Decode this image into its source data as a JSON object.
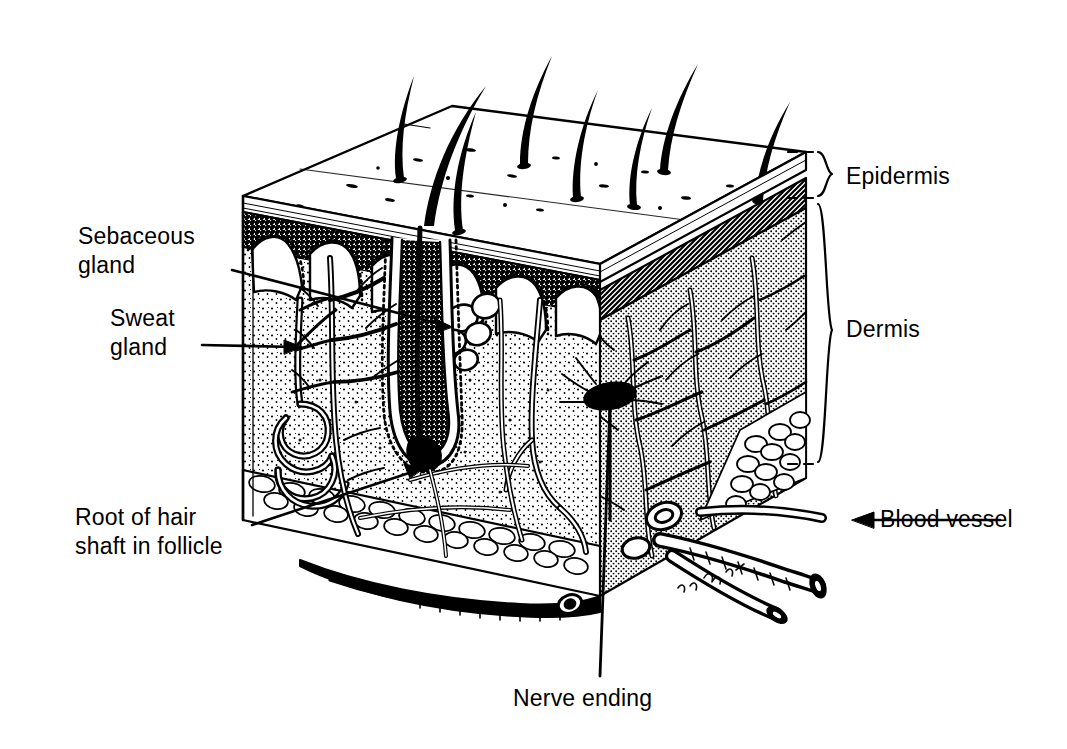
{
  "figure": {
    "kind": "anatomical-cross-section",
    "style": "black-and-white pen-and-ink line drawing",
    "signature": "R. Brent"
  },
  "labels": {
    "epidermis": "Epidermis",
    "dermis": "Dermis",
    "sebaceous_gland": "Sebaceous\ngland",
    "sebaceous_gland_line1": "Sebaceous",
    "sebaceous_gland_line2": "gland",
    "sweat_gland_line1": "Sweat",
    "sweat_gland_line2": "gland",
    "root_hair_line1": "Root of hair",
    "root_hair_line2": "shaft in follicle",
    "blood_vessel": "Blood vessel",
    "nerve_ending": "Nerve ending"
  },
  "colors": {
    "ink": "#000000",
    "paper": "#ffffff",
    "epidermis_band": "#1a1a1a",
    "dermis_stipple": "#000000"
  },
  "structures": [
    {
      "name": "hair shafts",
      "count": 8,
      "location": "epidermal surface"
    },
    {
      "name": "epidermis layer",
      "location": "top band of block"
    },
    {
      "name": "dermis layer",
      "location": "middle body of block"
    },
    {
      "name": "subcutaneous fat",
      "location": "bottom of block"
    },
    {
      "name": "sebaceous gland",
      "location": "upper dermis"
    },
    {
      "name": "sweat gland",
      "location": "lower dermis, coiled"
    },
    {
      "name": "hair follicle and root",
      "location": "deep dermis"
    },
    {
      "name": "nerve ending",
      "location": "mid dermis"
    },
    {
      "name": "blood vessel",
      "location": "subcutaneous layer"
    }
  ]
}
